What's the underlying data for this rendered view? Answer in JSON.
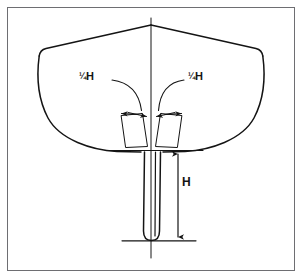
{
  "figure": {
    "background_color": "#ffffff",
    "frame": {
      "border_color": "#6e6e72",
      "border_width_px": 1,
      "x": 7,
      "y": 7,
      "width": 288,
      "height": 264
    },
    "line_color": "#141414",
    "text_color": "#141414"
  },
  "labels": {
    "quarter_h_left": "¼H",
    "quarter_h_right": "¼H",
    "keel_depth": "H"
  },
  "annotations": [
    {
      "id": "quarter-h-left",
      "text": "¼H",
      "meaning": "one quarter of keel depth H, measured to port of centerline",
      "leader": "curved leader line from label to left arrow pair"
    },
    {
      "id": "quarter-h-right",
      "text": "¼H",
      "meaning": "one quarter of keel depth H, measured to starboard of centerline",
      "leader": "curved leader line from label to right arrow pair"
    },
    {
      "id": "keel-depth-h",
      "text": "H",
      "meaning": "total keel/fin depth below the baseline",
      "leader": "double-headed vertical dimension arrow"
    }
  ],
  "geometry": {
    "centerline": {
      "x": 151,
      "y_top": 18,
      "y_bottom": 258
    },
    "deck_apex": {
      "x": 151,
      "y": 25
    },
    "deck_corner_left": {
      "x": 40,
      "y": 50
    },
    "deck_corner_right": {
      "x": 262,
      "y": 50
    },
    "waterline_y": 150,
    "waterline_x_start": 110,
    "waterline_x_end": 203,
    "keel_baseline_y": 241,
    "keel_baseline_x_start": 122,
    "keel_baseline_x_end": 196,
    "keel_left_x": 144,
    "keel_right_x": 163,
    "dimension_arrow_x": 178,
    "dimension_arrow_y_top": 151,
    "dimension_arrow_y_bottom": 240
  }
}
